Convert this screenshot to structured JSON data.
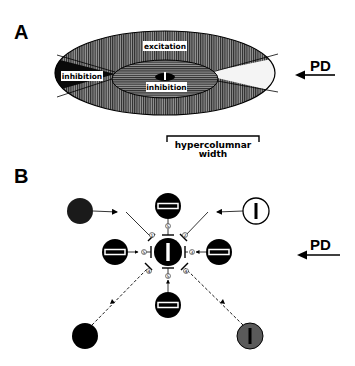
{
  "panel_a": {
    "label": "A",
    "regions": {
      "outer": "excitation",
      "flank_left": "inhibition",
      "center": "inhibition"
    },
    "direction_label": "PD",
    "scale_bar": {
      "line1": "hypercolumnar",
      "line2": "width"
    }
  },
  "panel_b": {
    "label": "B",
    "direction_label": "PD",
    "center_cell": {
      "orientation": "vertical",
      "fill": "#000000"
    },
    "surround_cells": [
      {
        "position": "top",
        "orientation": "horizontal",
        "fill": "#000000",
        "connection": "inhibitory",
        "number": "5"
      },
      {
        "position": "left",
        "orientation": "horizontal",
        "fill": "#000000",
        "connection": "inhibitory",
        "number": "5"
      },
      {
        "position": "right",
        "orientation": "horizontal",
        "fill": "#000000",
        "connection": "inhibitory",
        "number": "3"
      },
      {
        "position": "bottom",
        "orientation": "horizontal",
        "fill": "#000000",
        "connection": "inhibitory",
        "number": "5"
      }
    ],
    "corner_cells": [
      {
        "position": "top-left",
        "orientation": "none",
        "fill": "#1a1a1a",
        "connection": "solid-arrow",
        "number": "1"
      },
      {
        "position": "top-right",
        "orientation": "vertical",
        "fill": "#ffffff",
        "connection": "solid-arrow",
        "number": "2"
      },
      {
        "position": "bottom-left",
        "orientation": "none",
        "fill": "#000000",
        "connection": "dashed-arrow",
        "number": "4"
      },
      {
        "position": "bottom-right",
        "orientation": "vertical",
        "fill": "#555555",
        "connection": "dashed-arrow",
        "number": "4"
      }
    ]
  },
  "colors": {
    "ink": "#000000",
    "hatch_fill": "#6e6e6e",
    "white_wedge": "#f2f2f2",
    "background": "#ffffff"
  }
}
